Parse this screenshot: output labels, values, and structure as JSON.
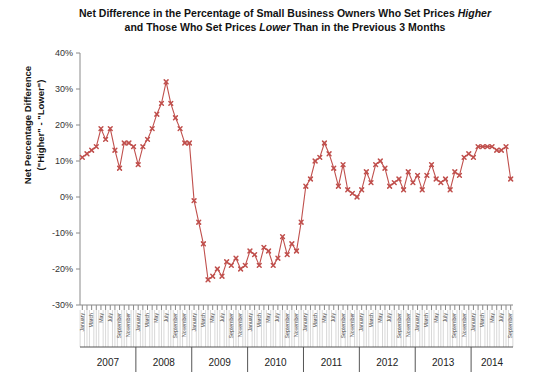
{
  "chart_data": {
    "type": "line",
    "title": "Net Difference in the Percentage of Small Business Owners Who Set Prices Higher and Those Who Set Prices Lower Than in the Previous 3 Months",
    "title_line1_a": "Net Difference in the Percentage of Small Business Owners Who Set Prices ",
    "title_line1_em": "Higher",
    "title_line2_a": "and Those Who Set Prices ",
    "title_line2_em": "Lower",
    "title_line2_b": " Than in the Previous 3 Months",
    "xlabel": "",
    "ylabel": "Net Percentage Difference (\"Higher\" - \"Lower\")",
    "ylabel_line1": "Net Percentage Difference",
    "ylabel_line2": "(\"Higher\" - \"Lower\")",
    "ylim": [
      -30,
      40
    ],
    "ytick_values": [
      40,
      30,
      20,
      10,
      0,
      -10,
      -20,
      -30
    ],
    "ytick_labels": [
      "40%",
      "30%",
      "20%",
      "10%",
      "0%",
      "-10%",
      "-20%",
      "-30%"
    ],
    "grid": false,
    "legend": "none",
    "series_color": "#c0504d",
    "marker": "x-cross",
    "years": [
      "2007",
      "2008",
      "2009",
      "2010",
      "2011",
      "2012",
      "2013",
      "2014"
    ],
    "month_tick_labels": [
      "January",
      "March",
      "May",
      "July",
      "September",
      "November"
    ],
    "months_all": [
      "January",
      "February",
      "March",
      "April",
      "May",
      "June",
      "July",
      "August",
      "September",
      "October",
      "November",
      "December"
    ],
    "x": [
      "2007-01",
      "2007-02",
      "2007-03",
      "2007-04",
      "2007-05",
      "2007-06",
      "2007-07",
      "2007-08",
      "2007-09",
      "2007-10",
      "2007-11",
      "2007-12",
      "2008-01",
      "2008-02",
      "2008-03",
      "2008-04",
      "2008-05",
      "2008-06",
      "2008-07",
      "2008-08",
      "2008-09",
      "2008-10",
      "2008-11",
      "2008-12",
      "2009-01",
      "2009-02",
      "2009-03",
      "2009-04",
      "2009-05",
      "2009-06",
      "2009-07",
      "2009-08",
      "2009-09",
      "2009-10",
      "2009-11",
      "2009-12",
      "2010-01",
      "2010-02",
      "2010-03",
      "2010-04",
      "2010-05",
      "2010-06",
      "2010-07",
      "2010-08",
      "2010-09",
      "2010-10",
      "2010-11",
      "2010-12",
      "2011-01",
      "2011-02",
      "2011-03",
      "2011-04",
      "2011-05",
      "2011-06",
      "2011-07",
      "2011-08",
      "2011-09",
      "2011-10",
      "2011-11",
      "2011-12",
      "2012-01",
      "2012-02",
      "2012-03",
      "2012-04",
      "2012-05",
      "2012-06",
      "2012-07",
      "2012-08",
      "2012-09",
      "2012-10",
      "2012-11",
      "2012-12",
      "2013-01",
      "2013-02",
      "2013-03",
      "2013-04",
      "2013-05",
      "2013-06",
      "2013-07",
      "2013-08",
      "2013-09",
      "2013-10",
      "2013-11",
      "2013-12",
      "2014-01",
      "2014-02",
      "2014-03",
      "2014-04",
      "2014-05",
      "2014-06",
      "2014-07",
      "2014-08",
      "2014-09"
    ],
    "values": [
      11,
      12,
      13,
      14,
      19,
      16,
      19,
      13,
      8,
      15,
      15,
      14,
      9,
      14,
      16,
      19,
      23,
      26,
      32,
      26,
      22,
      19,
      15,
      15,
      -1,
      -7,
      -13,
      -23,
      -22,
      -20,
      -22,
      -18,
      -19,
      -17,
      -20,
      -19,
      -15,
      -16,
      -19,
      -14,
      -15,
      -19,
      -17,
      -11,
      -16,
      -13,
      -15,
      -7,
      3,
      5,
      10,
      11,
      15,
      12,
      8,
      3,
      9,
      2,
      1,
      0,
      2,
      7,
      4,
      9,
      10,
      8,
      3,
      4,
      5,
      2,
      7,
      4,
      6,
      2,
      6,
      9,
      5,
      4,
      5,
      2,
      7,
      6,
      11,
      12,
      11,
      14,
      14,
      14,
      14,
      13,
      13,
      14,
      5
    ]
  }
}
